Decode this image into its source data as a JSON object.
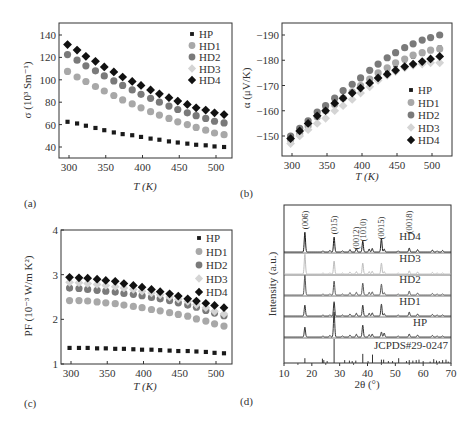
{
  "series_styles": {
    "HP": {
      "marker": "square",
      "color": "#1a1a1a"
    },
    "HD1": {
      "marker": "circle",
      "color": "#a8a8a8"
    },
    "HD2": {
      "marker": "circle",
      "color": "#7a7a7a"
    },
    "HD3": {
      "marker": "diamond",
      "color": "#d4d4d4"
    },
    "HD4": {
      "marker": "diamond",
      "color": "#111111"
    }
  },
  "chart_data": [
    {
      "id": "a",
      "panel_label": "(a)",
      "type": "scatter",
      "title": "",
      "xlabel": "T (K)",
      "ylabel": "σ (10³ Sm⁻¹)",
      "xlim": [
        285,
        520
      ],
      "ylim": [
        30,
        148
      ],
      "xticks": [
        300,
        350,
        400,
        450,
        500
      ],
      "yticks": [
        40,
        60,
        80,
        100,
        120,
        140
      ],
      "legend": "top-right",
      "x": [
        298,
        311,
        323,
        336,
        348,
        361,
        373,
        386,
        398,
        411,
        423,
        436,
        448,
        461,
        473,
        486,
        498,
        511
      ],
      "series": [
        {
          "name": "HP",
          "values": [
            62.5,
            61,
            59,
            57,
            55,
            53,
            51.5,
            50.5,
            49,
            47.5,
            46.5,
            45,
            44,
            43,
            42,
            41.5,
            40.5,
            40
          ]
        },
        {
          "name": "HD1",
          "values": [
            107.5,
            102.5,
            98.5,
            94,
            90,
            86,
            82,
            78.5,
            75,
            71.5,
            68.5,
            65.5,
            62.5,
            60,
            57.5,
            55,
            52.5,
            51
          ]
        },
        {
          "name": "HD2",
          "values": [
            122.5,
            117.5,
            112.5,
            108,
            103.5,
            99,
            95,
            91,
            87,
            83.5,
            80,
            76.5,
            73.5,
            70.5,
            68,
            65.5,
            63,
            61.5
          ]
        },
        {
          "name": "HD3",
          "values": [
            131.5,
            126.5,
            121,
            116.5,
            111.5,
            107,
            102.5,
            98.5,
            95,
            91,
            87,
            84,
            81,
            78,
            75,
            73,
            70.5,
            69
          ]
        },
        {
          "name": "HD4",
          "values": [
            131.5,
            126.5,
            121,
            116.5,
            111.5,
            107,
            102.5,
            98.5,
            95,
            91,
            87.5,
            84,
            81,
            78,
            75,
            73,
            70.5,
            69
          ]
        }
      ]
    },
    {
      "id": "b",
      "panel_label": "(b)",
      "type": "scatter",
      "title": "",
      "xlabel": "T (K)",
      "ylabel": "α (μV/K)",
      "xlim": [
        285,
        520
      ],
      "ylim": [
        -145.5,
        -194
      ],
      "xticks": [
        300,
        350,
        400,
        450,
        500
      ],
      "yticks": [
        -150,
        -160,
        -170,
        -180,
        -190
      ],
      "legend": "bottom-right",
      "x": [
        298,
        311,
        323,
        336,
        348,
        361,
        373,
        386,
        398,
        411,
        423,
        436,
        448,
        461,
        473,
        486,
        498,
        511
      ],
      "series": [
        {
          "name": "HP",
          "values": [
            -149,
            -152,
            -155,
            -158,
            -160.5,
            -163,
            -165,
            -167,
            -169.5,
            -171.5,
            -174,
            -176,
            -178,
            -180,
            -181.5,
            -182.5,
            -184,
            -185
          ]
        },
        {
          "name": "HD1",
          "values": [
            -148.5,
            -151,
            -154,
            -157.5,
            -160,
            -162.5,
            -165,
            -167.5,
            -170,
            -172.5,
            -175,
            -177,
            -179,
            -180.5,
            -182,
            -183,
            -184,
            -184.5
          ]
        },
        {
          "name": "HD2",
          "values": [
            -150,
            -153,
            -156,
            -159.5,
            -162,
            -165,
            -168,
            -170.5,
            -173,
            -176,
            -178.5,
            -181,
            -183,
            -185,
            -186.5,
            -188,
            -189,
            -190
          ]
        },
        {
          "name": "HD3",
          "values": [
            -147,
            -150,
            -152.5,
            -155,
            -157,
            -160,
            -162,
            -164.5,
            -167,
            -169.5,
            -172,
            -174,
            -175.5,
            -177,
            -178,
            -178.5,
            -179,
            -179
          ]
        },
        {
          "name": "HD4",
          "values": [
            -149,
            -152,
            -155,
            -158,
            -160,
            -163,
            -165,
            -167,
            -169,
            -171,
            -173,
            -174.5,
            -176,
            -177.5,
            -178.5,
            -179.5,
            -180.5,
            -181.5
          ]
        }
      ]
    },
    {
      "id": "c",
      "panel_label": "(c)",
      "type": "scatter",
      "title": "",
      "xlabel": "T (K)",
      "ylabel": "PF (10⁻³ W/m K²)",
      "xlim": [
        285,
        520
      ],
      "ylim": [
        1,
        4
      ],
      "xticks": [
        300,
        350,
        400,
        450,
        500
      ],
      "yticks": [
        1,
        2,
        3,
        4
      ],
      "legend": "top-right",
      "x": [
        298,
        311,
        323,
        336,
        348,
        361,
        373,
        386,
        398,
        411,
        423,
        436,
        448,
        461,
        473,
        486,
        498,
        511
      ],
      "series": [
        {
          "name": "HP",
          "values": [
            1.36,
            1.36,
            1.36,
            1.35,
            1.35,
            1.34,
            1.34,
            1.33,
            1.32,
            1.32,
            1.31,
            1.3,
            1.29,
            1.29,
            1.28,
            1.27,
            1.25,
            1.24
          ]
        },
        {
          "name": "HD1",
          "values": [
            2.42,
            2.42,
            2.41,
            2.39,
            2.37,
            2.35,
            2.32,
            2.29,
            2.26,
            2.22,
            2.19,
            2.15,
            2.11,
            2.07,
            2.01,
            1.96,
            1.9,
            1.85
          ]
        },
        {
          "name": "HD2",
          "values": [
            2.7,
            2.69,
            2.67,
            2.65,
            2.63,
            2.61,
            2.58,
            2.56,
            2.53,
            2.49,
            2.46,
            2.42,
            2.37,
            2.32,
            2.27,
            2.2,
            2.14,
            2.08
          ]
        },
        {
          "name": "HD3",
          "values": [
            2.83,
            2.82,
            2.8,
            2.78,
            2.76,
            2.73,
            2.7,
            2.67,
            2.63,
            2.59,
            2.55,
            2.5,
            2.45,
            2.4,
            2.33,
            2.26,
            2.18,
            2.12
          ]
        },
        {
          "name": "HD4",
          "values": [
            2.94,
            2.93,
            2.92,
            2.9,
            2.87,
            2.85,
            2.8,
            2.76,
            2.72,
            2.67,
            2.62,
            2.57,
            2.52,
            2.46,
            2.41,
            2.36,
            2.31,
            2.26
          ]
        }
      ]
    },
    {
      "id": "d",
      "panel_label": "(d)",
      "type": "line",
      "title": "",
      "xlabel": "2θ (°)",
      "ylabel": "Intensity (a.u.)",
      "xlim": [
        10,
        70
      ],
      "xticks": [
        10,
        20,
        30,
        40,
        50,
        60,
        70
      ],
      "yticks": [],
      "legend": "none",
      "peak_labels": [
        {
          "text": "(006)",
          "x": 17.5
        },
        {
          "text": "(015)",
          "x": 28.0
        },
        {
          "text": "(0012)",
          "x": 36.0
        },
        {
          "text": "(1010)",
          "x": 38.3
        },
        {
          "text": "(0015)",
          "x": 45.0
        },
        {
          "text": "(0018)",
          "x": 55.0
        }
      ],
      "series": [
        {
          "name": "HD4",
          "color": "#1a1a1a",
          "peaks": [
            [
              17.5,
              1.0
            ],
            [
              24.0,
              0.06
            ],
            [
              26.5,
              0.08
            ],
            [
              28.0,
              0.75
            ],
            [
              31.0,
              0.06
            ],
            [
              33.7,
              0.12
            ],
            [
              36.0,
              0.18
            ],
            [
              38.3,
              0.55
            ],
            [
              40.6,
              0.15
            ],
            [
              41.7,
              0.18
            ],
            [
              45.0,
              0.68
            ],
            [
              46.0,
              0.15
            ],
            [
              51.0,
              0.06
            ],
            [
              55.0,
              0.2
            ],
            [
              58.0,
              0.12
            ],
            [
              63.3,
              0.1
            ],
            [
              65.0,
              0.06
            ],
            [
              67.0,
              0.08
            ]
          ]
        },
        {
          "name": "HD3",
          "color": "#bdbdbd",
          "peaks": [
            [
              17.5,
              1.0
            ],
            [
              24.0,
              0.05
            ],
            [
              26.5,
              0.06
            ],
            [
              28.0,
              0.65
            ],
            [
              31.0,
              0.05
            ],
            [
              33.7,
              0.1
            ],
            [
              36.0,
              0.12
            ],
            [
              38.3,
              0.55
            ],
            [
              40.6,
              0.12
            ],
            [
              41.7,
              0.14
            ],
            [
              45.0,
              0.55
            ],
            [
              46.0,
              0.12
            ],
            [
              51.0,
              0.05
            ],
            [
              55.0,
              0.16
            ],
            [
              58.0,
              0.1
            ],
            [
              63.3,
              0.08
            ],
            [
              65.0,
              0.05
            ],
            [
              67.0,
              0.06
            ]
          ]
        },
        {
          "name": "HD2",
          "color": "#555555",
          "peaks": [
            [
              17.5,
              1.0
            ],
            [
              24.0,
              0.05
            ],
            [
              26.5,
              0.06
            ],
            [
              28.0,
              0.7
            ],
            [
              31.0,
              0.05
            ],
            [
              33.7,
              0.12
            ],
            [
              36.0,
              0.14
            ],
            [
              38.3,
              0.6
            ],
            [
              40.6,
              0.14
            ],
            [
              41.7,
              0.16
            ],
            [
              45.0,
              0.55
            ],
            [
              46.0,
              0.12
            ],
            [
              51.0,
              0.05
            ],
            [
              55.0,
              0.2
            ],
            [
              58.0,
              0.1
            ],
            [
              63.3,
              0.08
            ],
            [
              65.0,
              0.05
            ],
            [
              67.0,
              0.06
            ]
          ]
        },
        {
          "name": "HD1",
          "color": "#333333",
          "peaks": [
            [
              17.5,
              0.55
            ],
            [
              24.0,
              0.05
            ],
            [
              26.5,
              0.06
            ],
            [
              28.0,
              0.72
            ],
            [
              31.0,
              0.05
            ],
            [
              33.7,
              0.1
            ],
            [
              36.0,
              0.14
            ],
            [
              38.3,
              0.55
            ],
            [
              40.6,
              0.14
            ],
            [
              41.7,
              0.16
            ],
            [
              45.0,
              0.6
            ],
            [
              46.0,
              0.12
            ],
            [
              51.0,
              0.05
            ],
            [
              55.0,
              0.2
            ],
            [
              58.0,
              0.1
            ],
            [
              63.3,
              0.08
            ],
            [
              65.0,
              0.05
            ],
            [
              67.0,
              0.06
            ]
          ]
        },
        {
          "name": "HP",
          "color": "#333333",
          "peaks": [
            [
              17.5,
              0.5
            ],
            [
              24.0,
              0.05
            ],
            [
              26.5,
              0.08
            ],
            [
              28.0,
              1.25
            ],
            [
              31.0,
              0.06
            ],
            [
              33.7,
              0.1
            ],
            [
              36.0,
              0.14
            ],
            [
              38.3,
              0.6
            ],
            [
              40.6,
              0.12
            ],
            [
              41.7,
              0.15
            ],
            [
              45.0,
              0.25
            ],
            [
              46.0,
              0.2
            ],
            [
              51.0,
              0.05
            ],
            [
              55.0,
              0.15
            ],
            [
              58.0,
              0.1
            ],
            [
              63.3,
              0.08
            ],
            [
              65.0,
              0.05
            ],
            [
              67.0,
              0.06
            ]
          ]
        }
      ],
      "reference": {
        "name": "JCPDS#29-0247",
        "sticks": [
          [
            17.5,
            0.2
          ],
          [
            23.8,
            0.18
          ],
          [
            24.3,
            0.12
          ],
          [
            25.5,
            0.08
          ],
          [
            28.0,
            1.0
          ],
          [
            31.8,
            0.12
          ],
          [
            33.5,
            0.1
          ],
          [
            34.5,
            0.08
          ],
          [
            35.8,
            0.1
          ],
          [
            38.3,
            0.38
          ],
          [
            40.2,
            0.08
          ],
          [
            41.8,
            0.35
          ],
          [
            45.0,
            0.14
          ],
          [
            45.8,
            0.14
          ],
          [
            47.5,
            0.08
          ],
          [
            49.0,
            0.08
          ],
          [
            51.2,
            0.2
          ],
          [
            54.0,
            0.08
          ],
          [
            55.0,
            0.12
          ],
          [
            56.3,
            0.1
          ],
          [
            57.5,
            0.12
          ],
          [
            58.5,
            0.14
          ],
          [
            60.0,
            0.08
          ],
          [
            62.5,
            0.06
          ],
          [
            63.8,
            0.16
          ],
          [
            64.8,
            0.1
          ],
          [
            65.8,
            0.08
          ],
          [
            67.0,
            0.12
          ],
          [
            68.2,
            0.14
          ],
          [
            69.0,
            0.06
          ]
        ]
      }
    }
  ]
}
